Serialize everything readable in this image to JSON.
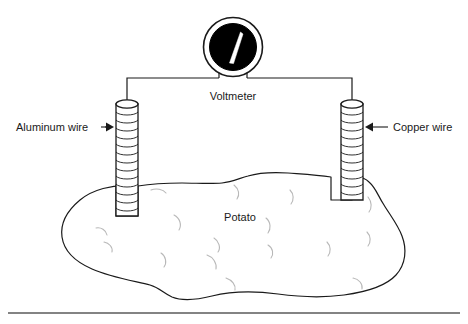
{
  "figure": {
    "background_color": "#ffffff",
    "stroke_color": "#1a1a1a",
    "faint_stroke_color": "#b0b0b0",
    "width": 468,
    "height": 324
  },
  "meter": {
    "label": "Voltmeter",
    "dial_fill": "#000000",
    "needle_color": "#ffffff",
    "case_stroke": "#1a1a1a",
    "center_x": 233,
    "center_y": 47,
    "outer_radius": 30,
    "inner_radius": 24
  },
  "electrodes": [
    {
      "id": "aluminum",
      "label": "Aluminum wire",
      "label_x": 16,
      "label_y": 130,
      "arrow_from_x": 88,
      "arrow_to_x": 112,
      "arrow_y": 127,
      "arrow_direction": "right",
      "cylinder_x": 116,
      "cylinder_top_y": 100,
      "cylinder_bottom_y": 216,
      "cylinder_width": 22,
      "coil_count": 13
    },
    {
      "id": "copper",
      "label": "Copper wire",
      "label_x": 393,
      "label_y": 130,
      "arrow_from_x": 388,
      "arrow_to_x": 364,
      "arrow_y": 127,
      "arrow_direction": "left",
      "cylinder_x": 341,
      "cylinder_top_y": 100,
      "cylinder_bottom_y": 200,
      "cylinder_width": 22,
      "coil_count": 11
    }
  ],
  "wiring": {
    "bus_y": 78,
    "left_lead_x": 219,
    "right_lead_x": 247,
    "left_post_x": 127,
    "right_post_x": 352,
    "meter_bottom_y": 70
  },
  "potato": {
    "label": "Potato",
    "label_x": 240,
    "label_y": 221,
    "fill": "#ffffff",
    "stroke": "#1a1a1a",
    "eye_count": 14
  },
  "footer_rule": {
    "y": 313,
    "x_start": 8,
    "x_end": 460,
    "color": "#5a5a5a"
  }
}
